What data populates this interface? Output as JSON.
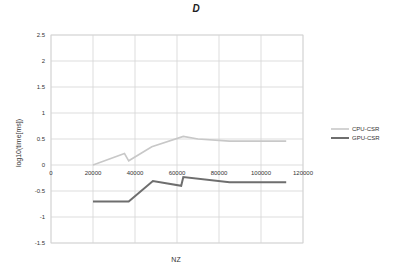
{
  "chart_data": {
    "type": "line",
    "title": "D",
    "xlabel": "NZ",
    "ylabel": "log10(time[ms])",
    "xlim": [
      0,
      120000
    ],
    "ylim": [
      -1.5,
      2.5
    ],
    "x_ticks": [
      0,
      20000,
      40000,
      60000,
      80000,
      100000,
      120000
    ],
    "x_tick_labels": [
      "0",
      "20000",
      "40000",
      "60000",
      "80000",
      "100000",
      "120000"
    ],
    "y_ticks": [
      2.5,
      2,
      1.5,
      1,
      0.5,
      0,
      -0.5,
      -1,
      -1.5
    ],
    "y_tick_labels": [
      "2.5",
      "2",
      "1.5",
      "1",
      "0.5",
      "0",
      "-0.5",
      "-1",
      "-1.5"
    ],
    "grid": true,
    "legend_position": "right",
    "series": [
      {
        "name": "CPU-CSR",
        "color": "#c8c8c8",
        "width": 1.6,
        "x": [
          20000,
          35000,
          37000,
          48000,
          63000,
          70000,
          85000,
          112000
        ],
        "y": [
          0.0,
          0.22,
          0.08,
          0.35,
          0.55,
          0.5,
          0.46,
          0.46
        ]
      },
      {
        "name": "GPU-CSR",
        "color": "#6e6e6e",
        "width": 2.0,
        "x": [
          20000,
          37000,
          48500,
          62000,
          63000,
          85000,
          112000
        ],
        "y": [
          -0.7,
          -0.7,
          -0.31,
          -0.4,
          -0.23,
          -0.33,
          -0.33
        ]
      }
    ]
  }
}
